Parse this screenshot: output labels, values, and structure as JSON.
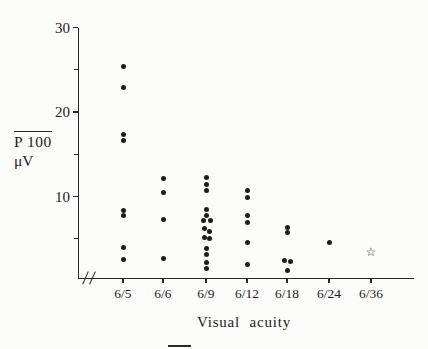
{
  "figure": {
    "y_axis_label_line1": "P 100",
    "y_axis_label_line2": "μV",
    "x_axis_label": "Visual acuity"
  },
  "chart_data": {
    "type": "scatter",
    "title": "",
    "xlabel": "Visual acuity",
    "ylabel": "P100 amplitude (μV)",
    "x_categories": [
      "6/5",
      "6/6",
      "6/9",
      "6/12",
      "6/18",
      "6/24",
      "6/36"
    ],
    "y_major_ticks": [
      30,
      20,
      10
    ],
    "y_minor_ticks": [
      25,
      15,
      5
    ],
    "ylim": [
      0,
      30
    ],
    "x_axis_break": true,
    "grid": false,
    "legend": "none",
    "marker_color": "#1c1c1c",
    "series": [
      {
        "name": "filled-dots",
        "marker": "filled-circle",
        "color": "#1c1c1c",
        "points": [
          {
            "x": "6/5",
            "y": 25.4
          },
          {
            "x": "6/5",
            "y": 22.9
          },
          {
            "x": "6/5",
            "y": 17.3
          },
          {
            "x": "6/5",
            "y": 16.6
          },
          {
            "x": "6/5",
            "y": 8.4
          },
          {
            "x": "6/5",
            "y": 7.7
          },
          {
            "x": "6/5",
            "y": 4.0
          },
          {
            "x": "6/5",
            "y": 2.6
          },
          {
            "x": "6/6",
            "y": 12.1
          },
          {
            "x": "6/6",
            "y": 10.5
          },
          {
            "x": "6/6",
            "y": 7.3
          },
          {
            "x": "6/6",
            "y": 2.7
          },
          {
            "x": "6/9",
            "y": 12.2
          },
          {
            "x": "6/9",
            "y": 11.4
          },
          {
            "x": "6/9",
            "y": 10.7
          },
          {
            "x": "6/9",
            "y": 8.5
          },
          {
            "x": "6/9",
            "y": 7.7
          },
          {
            "x": "6/9",
            "y": 7.2,
            "dx": -3
          },
          {
            "x": "6/9",
            "y": 7.2,
            "dx": 4
          },
          {
            "x": "6/9",
            "y": 6.2,
            "dx": -2
          },
          {
            "x": "6/9",
            "y": 5.8,
            "dx": 3
          },
          {
            "x": "6/9",
            "y": 5.2,
            "dx": -2
          },
          {
            "x": "6/9",
            "y": 5.0,
            "dx": 3
          },
          {
            "x": "6/9",
            "y": 3.8
          },
          {
            "x": "6/9",
            "y": 3.1
          },
          {
            "x": "6/9",
            "y": 2.2
          },
          {
            "x": "6/9",
            "y": 1.5
          },
          {
            "x": "6/12",
            "y": 10.7
          },
          {
            "x": "6/12",
            "y": 9.9
          },
          {
            "x": "6/12",
            "y": 7.8
          },
          {
            "x": "6/12",
            "y": 6.9
          },
          {
            "x": "6/12",
            "y": 4.6
          },
          {
            "x": "6/12",
            "y": 1.9
          },
          {
            "x": "6/18",
            "y": 6.3
          },
          {
            "x": "6/18",
            "y": 5.7
          },
          {
            "x": "6/18",
            "y": 2.4,
            "dx": -3
          },
          {
            "x": "6/18",
            "y": 2.3,
            "dx": 3
          },
          {
            "x": "6/18",
            "y": 1.2
          },
          {
            "x": "6/24",
            "y": 4.5
          }
        ]
      },
      {
        "name": "open-star-point",
        "marker": "open-star",
        "symbol": "☆",
        "color": "#1c1c1c",
        "points": [
          {
            "x": "6/36",
            "y": 3.4
          }
        ]
      }
    ]
  }
}
